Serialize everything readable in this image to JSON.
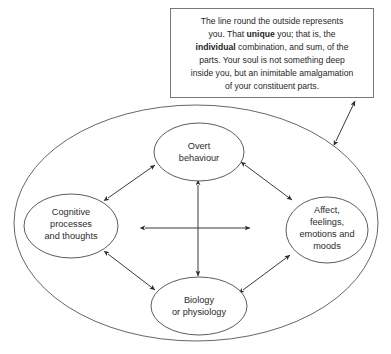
{
  "figure": {
    "outer_boundary_label": "the whole person outline"
  },
  "callout": {
    "lines": [
      "The line round the outside represents",
      "you. That unique you; that is, the",
      "individual combination, and sum, of the",
      "parts. Your soul is not something deep",
      "inside you, but an inimitable amalgamation",
      "of your constituent parts."
    ],
    "line1": "The line round the outside represents",
    "line2_a": "you. That ",
    "line2_bold": "unique",
    "line2_b": " you; that is, the",
    "line3_bold": "individual",
    "line3_b": " combination, and sum, of the",
    "line4": "parts. Your soul is not something deep",
    "line5": "inside you, but an inimitable amalgamation",
    "line6": "of your constituent parts.",
    "emphasis_words": [
      "unique",
      "individual"
    ]
  },
  "nodes": {
    "top": {
      "id": "overt-behaviour",
      "lines": [
        "Overt",
        "behaviour"
      ],
      "line1": "Overt",
      "line2": "behaviour"
    },
    "left": {
      "id": "cognitive-processes",
      "lines": [
        "Cognitive",
        "processes",
        "and thoughts"
      ],
      "line1": "Cognitive",
      "line2": "processes",
      "line3": "and thoughts"
    },
    "right": {
      "id": "affect-feelings",
      "lines": [
        "Affect,",
        "feelings,",
        "emotions and",
        "moods"
      ],
      "line1": "Affect,",
      "line2": "feelings,",
      "line3": "emotions and",
      "line4": "moods"
    },
    "bottom": {
      "id": "biology-physiology",
      "lines": [
        "Biology",
        "or physiology"
      ],
      "line1": "Biology",
      "line2": "or physiology"
    }
  },
  "connections": [
    {
      "from": "cognitive-processes",
      "to": "overt-behaviour",
      "style": "double-arrow"
    },
    {
      "from": "overt-behaviour",
      "to": "affect-feelings",
      "style": "double-arrow"
    },
    {
      "from": "cognitive-processes",
      "to": "biology-physiology",
      "style": "double-arrow"
    },
    {
      "from": "biology-physiology",
      "to": "affect-feelings",
      "style": "double-arrow"
    },
    {
      "from": "cognitive-processes",
      "to": "affect-feelings",
      "style": "double-arrow-horizontal"
    },
    {
      "from": "overt-behaviour",
      "to": "biology-physiology",
      "style": "double-arrow-vertical"
    },
    {
      "from": "callout",
      "to": "outer-boundary",
      "style": "double-arrow-pointer"
    }
  ],
  "colors": {
    "background": "#ffffff",
    "stroke": "#4a4a4a",
    "outer_stroke": "#555555",
    "text": "#2b2b2b",
    "callout_stroke": "#6b6b6b",
    "arrow": "#2e2e2e"
  }
}
